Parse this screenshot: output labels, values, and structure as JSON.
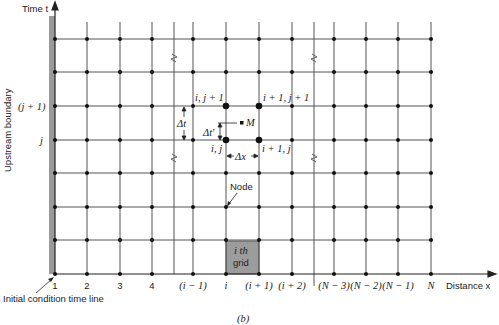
{
  "figure": {
    "caption": "(b)",
    "axes": {
      "y_label": "Time t",
      "x_label": "Distance x",
      "left_boundary_label": "Upstream boundary",
      "initial_line_label": "Initial condition time line"
    },
    "x_ticks": [
      "1",
      "2",
      "3",
      "4",
      "(i − 1)",
      "i",
      "(i + 1)",
      "(i + 2)",
      "(N − 3)",
      "(N − 2)",
      "(N − 1)",
      "N"
    ],
    "y_ticks": [
      "(j + 1)",
      "j"
    ],
    "node_labels": {
      "ij": "i, j",
      "ij1": "i, j + 1",
      "i1j": "i + 1, j",
      "i1j1": "i + 1, j + 1",
      "M": "M",
      "node": "Node",
      "grid_line1": "i th",
      "grid_line2": "grid"
    },
    "deltas": {
      "dt": "Δt",
      "dt_prime": "Δt'",
      "dx": "Δx"
    }
  },
  "colors": {
    "grid_line": "#555555",
    "node": "#111111",
    "boundary_bar": "#9a9a9a",
    "grid_cell": "#9c9c9c"
  }
}
